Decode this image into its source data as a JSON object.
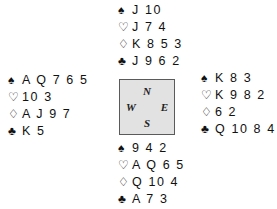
{
  "diagram": {
    "type": "bridge-deal",
    "suit_symbols": {
      "spade": "♠",
      "heart": "♡",
      "diamond": "♢",
      "club": "♣"
    },
    "compass": {
      "north": "N",
      "east": "E",
      "south": "S",
      "west": "W",
      "box_fill": "#e2e2e2",
      "box_border": "#5a5a5a"
    },
    "hands": {
      "north": {
        "label": "North",
        "spades": "J 10",
        "hearts": "J 7 4",
        "diamonds": "K 8 5 3",
        "clubs": "J 9 6 2"
      },
      "west": {
        "label": "West",
        "spades": "A Q 7 6 5",
        "hearts": "10 3",
        "diamonds": "A J 9 7",
        "clubs": "K 5"
      },
      "east": {
        "label": "East",
        "spades": "K 8 3",
        "hearts": "K 9 8 2",
        "diamonds": "6 2",
        "clubs": "Q 10 8 4"
      },
      "south": {
        "label": "South",
        "spades": "9 4 2",
        "hearts": "A Q 6 5",
        "diamonds": "Q 10 4",
        "clubs": "A 7 3"
      }
    }
  }
}
